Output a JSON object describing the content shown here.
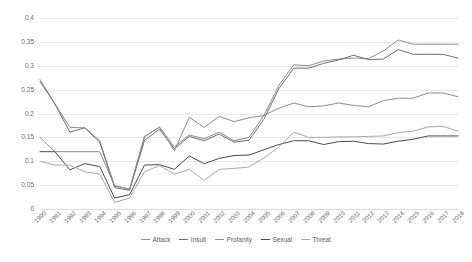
{
  "chart_data": {
    "type": "line",
    "title": "",
    "xlabel": "",
    "ylabel": "",
    "ylim": [
      0,
      0.4
    ],
    "ytick_values": [
      0,
      0.05,
      0.1,
      0.15,
      0.2,
      0.25,
      0.3,
      0.35,
      0.4
    ],
    "ytick_labels": [
      "0",
      "0.05",
      "0.1",
      "0.15",
      "0.2",
      "0.25",
      "0.3",
      "0.35",
      "0.4"
    ],
    "grid": true,
    "legend_position": "bottom",
    "categories": [
      "1990",
      "1991",
      "1992",
      "1993",
      "1994",
      "1995",
      "1996",
      "1997",
      "1998",
      "1999",
      "2000",
      "2001",
      "2002",
      "2003",
      "2004",
      "2005",
      "2006",
      "2007",
      "2008",
      "2009",
      "2010",
      "2011",
      "2012",
      "2013",
      "2014",
      "2015",
      "2016",
      "2017",
      "2018"
    ],
    "series": [
      {
        "name": "Attack",
        "color": "#8d8d8d",
        "values": [
          0.271,
          0.22,
          0.171,
          0.17,
          0.143,
          0.048,
          0.042,
          0.151,
          0.172,
          0.13,
          0.155,
          0.147,
          0.161,
          0.143,
          0.15,
          0.196,
          0.259,
          0.302,
          0.3,
          0.31,
          0.314,
          0.316,
          0.315,
          0.331,
          0.354,
          0.345,
          0.345,
          0.345,
          0.345
        ]
      },
      {
        "name": "Insult",
        "color": "#6e6e6e",
        "values": [
          0.267,
          0.22,
          0.161,
          0.17,
          0.14,
          0.045,
          0.039,
          0.144,
          0.167,
          0.126,
          0.152,
          0.143,
          0.157,
          0.14,
          0.144,
          0.188,
          0.252,
          0.295,
          0.295,
          0.305,
          0.312,
          0.322,
          0.313,
          0.314,
          0.334,
          0.324,
          0.324,
          0.324,
          0.316
        ]
      },
      {
        "name": "Profanity",
        "color": "#8d8d8d",
        "values": [
          0.15,
          0.12,
          0.12,
          0.12,
          0.12,
          0.049,
          0.041,
          0.152,
          0.171,
          0.122,
          0.192,
          0.171,
          0.194,
          0.183,
          0.191,
          0.196,
          0.211,
          0.222,
          0.214,
          0.216,
          0.222,
          0.217,
          0.214,
          0.227,
          0.232,
          0.232,
          0.243,
          0.243,
          0.235
        ]
      },
      {
        "name": "Sexual",
        "color": "#4a4a4a",
        "values": [
          0.12,
          0.12,
          0.082,
          0.095,
          0.089,
          0.023,
          0.03,
          0.092,
          0.093,
          0.083,
          0.111,
          0.095,
          0.106,
          0.112,
          0.113,
          0.124,
          0.135,
          0.143,
          0.143,
          0.135,
          0.141,
          0.142,
          0.137,
          0.136,
          0.142,
          0.146,
          0.153,
          0.153,
          0.153
        ]
      },
      {
        "name": "Threat",
        "color": "#a8a8a8",
        "values": [
          0.1,
          0.092,
          0.092,
          0.078,
          0.073,
          0.014,
          0.023,
          0.078,
          0.091,
          0.073,
          0.083,
          0.06,
          0.083,
          0.085,
          0.088,
          0.107,
          0.13,
          0.161,
          0.15,
          0.15,
          0.151,
          0.151,
          0.152,
          0.153,
          0.16,
          0.163,
          0.172,
          0.173,
          0.163
        ]
      }
    ]
  },
  "legend": {
    "items": [
      {
        "label": "Attack"
      },
      {
        "label": "Insult"
      },
      {
        "label": "Profanity"
      },
      {
        "label": "Sexual"
      },
      {
        "label": "Threat"
      }
    ]
  }
}
